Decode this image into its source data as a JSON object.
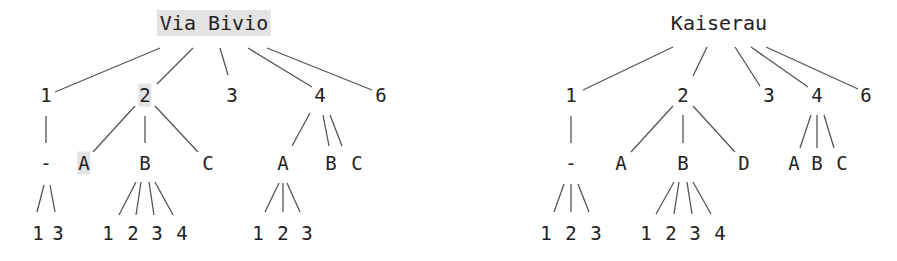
{
  "colors": {
    "line": "#555555",
    "text": "#222222",
    "highlight": "#e3e3e3"
  },
  "trees": [
    {
      "name": "left-tree",
      "nodes": [
        {
          "id": "r",
          "label": "Via Bivio",
          "x": 214,
          "y": 23,
          "root": true,
          "highlight": true
        },
        {
          "id": "n1",
          "label": "1",
          "x": 46,
          "y": 95
        },
        {
          "id": "n2",
          "label": "2",
          "x": 145,
          "y": 95,
          "highlight": true
        },
        {
          "id": "n3",
          "label": "3",
          "x": 232,
          "y": 95
        },
        {
          "id": "n4",
          "label": "4",
          "x": 320,
          "y": 95
        },
        {
          "id": "n6",
          "label": "6",
          "x": 381,
          "y": 95
        },
        {
          "id": "n1d",
          "label": "-",
          "x": 46,
          "y": 163
        },
        {
          "id": "n2a",
          "label": "A",
          "x": 84,
          "y": 163,
          "highlight": true
        },
        {
          "id": "n2b",
          "label": "B",
          "x": 145,
          "y": 163
        },
        {
          "id": "n2c",
          "label": "C",
          "x": 208,
          "y": 163
        },
        {
          "id": "n4a",
          "label": "A",
          "x": 283,
          "y": 163
        },
        {
          "id": "n4b",
          "label": "B",
          "x": 331,
          "y": 163
        },
        {
          "id": "n4c",
          "label": "C",
          "x": 357,
          "y": 163
        },
        {
          "id": "l1",
          "label": "1",
          "x": 38,
          "y": 233
        },
        {
          "id": "l3",
          "label": "3",
          "x": 58,
          "y": 233
        },
        {
          "id": "b1",
          "label": "1",
          "x": 108,
          "y": 233
        },
        {
          "id": "b2",
          "label": "2",
          "x": 133,
          "y": 233
        },
        {
          "id": "b3",
          "label": "3",
          "x": 157,
          "y": 233
        },
        {
          "id": "b4",
          "label": "4",
          "x": 182,
          "y": 233
        },
        {
          "id": "a1",
          "label": "1",
          "x": 258,
          "y": 233
        },
        {
          "id": "a2",
          "label": "2",
          "x": 283,
          "y": 233
        },
        {
          "id": "a3",
          "label": "3",
          "x": 307,
          "y": 233
        }
      ],
      "edges": [
        [
          160,
          48,
          55,
          92
        ],
        [
          193,
          48,
          157,
          84
        ],
        [
          220,
          48,
          228,
          75
        ],
        [
          248,
          48,
          312,
          87
        ],
        [
          267,
          48,
          372,
          90
        ],
        [
          46,
          116,
          46,
          143
        ],
        [
          135,
          106,
          93,
          152
        ],
        [
          145,
          116,
          145,
          143
        ],
        [
          155,
          106,
          198,
          152
        ],
        [
          310,
          113,
          292,
          146
        ],
        [
          323,
          115,
          329,
          146
        ],
        [
          330,
          115,
          342,
          146
        ],
        [
          44,
          185,
          37,
          212
        ],
        [
          50,
          185,
          55,
          212
        ],
        [
          136,
          182,
          119,
          215
        ],
        [
          141,
          182,
          136,
          215
        ],
        [
          149,
          182,
          154,
          215
        ],
        [
          155,
          182,
          173,
          215
        ],
        [
          279,
          183,
          265,
          212
        ],
        [
          283,
          183,
          283,
          212
        ],
        [
          287,
          183,
          300,
          212
        ]
      ]
    },
    {
      "name": "right-tree",
      "nodes": [
        {
          "id": "r",
          "label": "Kaiserau",
          "x": 719,
          "y": 23,
          "root": true
        },
        {
          "id": "n1",
          "label": "1",
          "x": 571,
          "y": 95
        },
        {
          "id": "n2",
          "label": "2",
          "x": 683,
          "y": 95
        },
        {
          "id": "n3",
          "label": "3",
          "x": 769,
          "y": 95
        },
        {
          "id": "n4",
          "label": "4",
          "x": 817,
          "y": 95
        },
        {
          "id": "n6",
          "label": "6",
          "x": 866,
          "y": 95
        },
        {
          "id": "n1d",
          "label": "-",
          "x": 571,
          "y": 163
        },
        {
          "id": "n2a",
          "label": "A",
          "x": 621,
          "y": 163
        },
        {
          "id": "n2b",
          "label": "B",
          "x": 683,
          "y": 163
        },
        {
          "id": "n2d",
          "label": "D",
          "x": 744,
          "y": 163
        },
        {
          "id": "n4a",
          "label": "A",
          "x": 794,
          "y": 163
        },
        {
          "id": "n4b",
          "label": "B",
          "x": 817,
          "y": 163
        },
        {
          "id": "n4c",
          "label": "C",
          "x": 842,
          "y": 163
        },
        {
          "id": "m1",
          "label": "1",
          "x": 546,
          "y": 233
        },
        {
          "id": "m2",
          "label": "2",
          "x": 571,
          "y": 233
        },
        {
          "id": "m3",
          "label": "3",
          "x": 596,
          "y": 233
        },
        {
          "id": "b1",
          "label": "1",
          "x": 646,
          "y": 233
        },
        {
          "id": "b2",
          "label": "2",
          "x": 671,
          "y": 233
        },
        {
          "id": "b3",
          "label": "3",
          "x": 695,
          "y": 233
        },
        {
          "id": "b4",
          "label": "4",
          "x": 720,
          "y": 233
        }
      ],
      "edges": [
        [
          673,
          47,
          583,
          90
        ],
        [
          707,
          47,
          693,
          76
        ],
        [
          735,
          47,
          760,
          86
        ],
        [
          751,
          47,
          808,
          87
        ],
        [
          766,
          47,
          858,
          89
        ],
        [
          571,
          116,
          571,
          143
        ],
        [
          673,
          106,
          631,
          152
        ],
        [
          683,
          115,
          683,
          143
        ],
        [
          693,
          106,
          735,
          152
        ],
        [
          811,
          115,
          800,
          148
        ],
        [
          817,
          115,
          817,
          148
        ],
        [
          824,
          115,
          834,
          148
        ],
        [
          564,
          184,
          554,
          212
        ],
        [
          571,
          184,
          571,
          212
        ],
        [
          578,
          184,
          589,
          212
        ],
        [
          674,
          182,
          656,
          214
        ],
        [
          679,
          182,
          674,
          214
        ],
        [
          687,
          182,
          692,
          214
        ],
        [
          693,
          182,
          711,
          214
        ]
      ]
    }
  ]
}
